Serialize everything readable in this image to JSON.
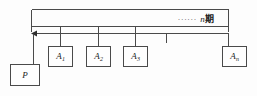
{
  "diagram": {
    "type": "cash-flow-timeline",
    "stroke_color": "#4a4a4a",
    "background_color": "#fdfdfd",
    "text_color": "#1a1a1a"
  },
  "annotation": {
    "dots": "......",
    "period_variable": "n",
    "period_unit": "期",
    "full_text": "n期"
  },
  "present_value": {
    "label": "P",
    "name": "present-value-node"
  },
  "payments": [
    {
      "label": "A",
      "subscript": "1",
      "name": "payment-node-a1"
    },
    {
      "label": "A",
      "subscript": "2",
      "name": "payment-node-a2"
    },
    {
      "label": "A",
      "subscript": "3",
      "name": "payment-node-a3"
    },
    {
      "label": "A",
      "subscript": "n",
      "name": "payment-node-an"
    }
  ],
  "arrow": {
    "name": "leftward-flow-arrow",
    "direction": "left"
  },
  "ticks": {
    "count": 5,
    "name": "timeline-tick-marks"
  }
}
